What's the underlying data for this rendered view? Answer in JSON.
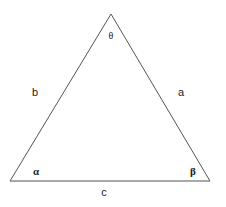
{
  "diagram": {
    "type": "triangle",
    "stroke_color": "#555555",
    "vertices": {
      "top": [
        111,
        14
      ],
      "bottom_left": [
        10,
        181
      ],
      "bottom_right": [
        210,
        181
      ]
    },
    "angles": {
      "top": "θ",
      "bottom_left": "α",
      "bottom_right": "β"
    },
    "sides": {
      "left": "b",
      "right": "a",
      "bottom": "c"
    }
  }
}
